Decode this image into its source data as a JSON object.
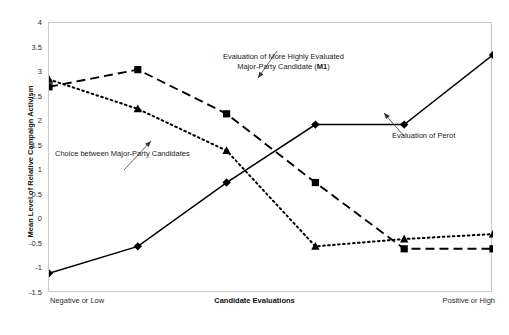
{
  "chart_data": {
    "type": "line",
    "title": "",
    "xlabel": "Candidate Evaluations",
    "ylabel": "Mean Level of Relative Campaign Activism",
    "xlim": [
      0,
      5
    ],
    "ylim": [
      -1.5,
      4
    ],
    "ytick_labels": [
      "4",
      "3.5",
      "3",
      "2.5",
      "2",
      "1.5",
      "1",
      "0.5",
      "0",
      "-0.5",
      "-1",
      "-1.5"
    ],
    "ytick_values": [
      4,
      3.5,
      3,
      2.5,
      2,
      1.5,
      1,
      0.5,
      0,
      -0.5,
      -1,
      -1.5
    ],
    "xtick_labels": [
      "Negative or Low",
      "",
      "",
      "",
      "",
      "Positive or High"
    ],
    "x": [
      0,
      1,
      2,
      3,
      4,
      5
    ],
    "grid": false,
    "legend": "annotations",
    "series": [
      {
        "name": "Evaluation of More Highly Evaluated Major-Party Candidate (M1)",
        "marker": "square",
        "linestyle": "dashed",
        "color": "#000000",
        "values": [
          2.7,
          3.05,
          2.15,
          0.75,
          -0.6,
          -0.6
        ]
      },
      {
        "name": "Choice between Major-Party Candidates",
        "marker": "triangle",
        "linestyle": "dotted",
        "color": "#000000",
        "values": [
          2.85,
          2.25,
          1.4,
          -0.55,
          -0.4,
          -0.3
        ]
      },
      {
        "name": "Evaluation of Perot",
        "marker": "diamond",
        "linestyle": "solid",
        "color": "#000000",
        "values": [
          -1.1,
          -0.55,
          0.75,
          1.93,
          1.93,
          3.35
        ]
      }
    ]
  },
  "axes": {
    "y_title": "Mean Level of Relative Campaign Activism",
    "x_title": "Candidate Evaluations",
    "x_left_label": "Negative or Low",
    "x_right_label": "Positive or High",
    "y_ticks": [
      "4",
      "3.5",
      "3",
      "2.5",
      "2",
      "1.5",
      "1",
      "0.5",
      "0",
      "-0.5",
      "-1",
      "-1.5"
    ]
  },
  "annotations": {
    "m1_line1": "Evaluation of More Highly Evaluated",
    "m1_line2_pre": "Major-Party Candidate (",
    "m1_line2_bold": "M1",
    "m1_line2_post": ")",
    "perot": "Evaluation of Perot",
    "choice": "Choice between Major-Party Candidates"
  }
}
